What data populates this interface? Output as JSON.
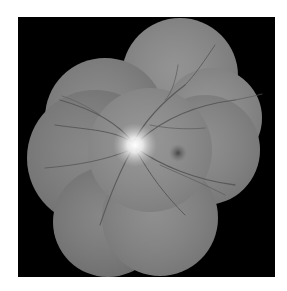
{
  "image": {
    "subject": "retinal fundus montage",
    "mode": "grayscale",
    "background_color": "#000000",
    "page_color": "#ffffff",
    "fields": [
      {
        "name": "top",
        "cx": 180,
        "cy": 76,
        "r": 58,
        "shade": "#8a8a8a"
      },
      {
        "name": "upper-left",
        "cx": 105,
        "cy": 118,
        "r": 60,
        "shade": "#828282"
      },
      {
        "name": "left",
        "cx": 95,
        "cy": 158,
        "r": 68,
        "shade": "#7e7e7e"
      },
      {
        "name": "right-upper",
        "cx": 212,
        "cy": 118,
        "r": 50,
        "shade": "#8c8c8c"
      },
      {
        "name": "right",
        "cx": 205,
        "cy": 150,
        "r": 55,
        "shade": "#868686"
      },
      {
        "name": "bottom-left",
        "cx": 108,
        "cy": 222,
        "r": 55,
        "shade": "#7c7c7c"
      },
      {
        "name": "bottom",
        "cx": 160,
        "cy": 218,
        "r": 58,
        "shade": "#858585"
      },
      {
        "name": "center",
        "cx": 150,
        "cy": 150,
        "r": 62,
        "shade": "#8e8e8e"
      }
    ],
    "optic_disc": {
      "cx": 135,
      "cy": 145,
      "r": 14
    },
    "macula": {
      "cx": 178,
      "cy": 153,
      "r": 8
    }
  }
}
